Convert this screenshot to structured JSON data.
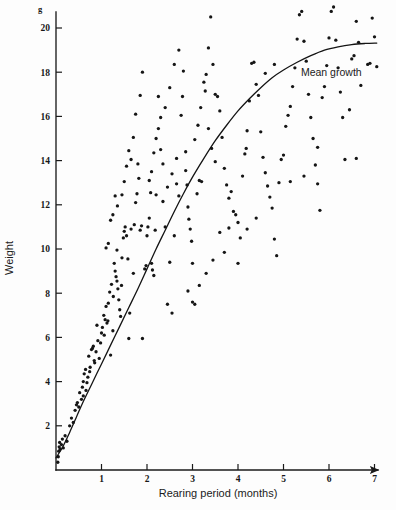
{
  "figure": {
    "background_color": "#fdfdfd",
    "ink_color": "#151515"
  },
  "annotations": {
    "mean_growth_label": "Mean growth",
    "mean_growth_label_x": 6.05,
    "mean_growth_label_y": 17.85
  },
  "chart_data": {
    "type": "scatter",
    "title": "",
    "xlabel": "Rearing period (months)",
    "ylabel": "Weight",
    "yunit": "g",
    "xlim": [
      0,
      7.6
    ],
    "ylim": [
      0,
      21.3
    ],
    "xticks": [
      1,
      2,
      3,
      4,
      5,
      6,
      7
    ],
    "xtick_labels": [
      "1",
      "2",
      "3",
      "4",
      "5",
      "6",
      "7"
    ],
    "yticks": [
      2,
      4,
      6,
      8,
      10,
      12,
      14,
      16,
      18,
      20
    ],
    "ytick_labels": [
      "2",
      "4",
      "6",
      "8",
      "10",
      "12",
      "14",
      "16",
      "18",
      "20"
    ],
    "grid": false,
    "legend": false,
    "x_axis_arrow": true,
    "series": [
      {
        "name": "Mean growth",
        "type": "line",
        "x": [
          0.0,
          0.15,
          0.3,
          0.45,
          0.6,
          0.8,
          1.0,
          1.2,
          1.4,
          1.6,
          1.8,
          2.0,
          2.2,
          2.4,
          2.6,
          2.8,
          3.0,
          3.25,
          3.5,
          3.75,
          4.0,
          4.25,
          4.5,
          4.75,
          5.0,
          5.3,
          5.6,
          5.9,
          6.2,
          6.5,
          6.8,
          7.05
        ],
        "y": [
          0.55,
          1.05,
          1.7,
          2.4,
          3.1,
          3.95,
          4.8,
          5.65,
          6.5,
          7.35,
          8.2,
          9.1,
          10.0,
          10.85,
          11.7,
          12.5,
          13.25,
          14.1,
          14.9,
          15.6,
          16.25,
          16.8,
          17.3,
          17.75,
          18.1,
          18.45,
          18.75,
          19.0,
          19.15,
          19.25,
          19.3,
          19.32
        ]
      },
      {
        "name": "Observations",
        "type": "scatter",
        "points": [
          [
            0.04,
            0.35
          ],
          [
            0.05,
            0.6
          ],
          [
            0.06,
            0.85
          ],
          [
            0.07,
            1.05
          ],
          [
            0.08,
            1.25
          ],
          [
            0.09,
            0.95
          ],
          [
            0.12,
            1.15
          ],
          [
            0.14,
            1.4
          ],
          [
            0.16,
            1.0
          ],
          [
            0.2,
            1.55
          ],
          [
            0.24,
            1.3
          ],
          [
            0.3,
            2.0
          ],
          [
            0.34,
            2.35
          ],
          [
            0.38,
            2.15
          ],
          [
            0.42,
            2.7
          ],
          [
            0.45,
            2.95
          ],
          [
            0.47,
            3.05
          ],
          [
            0.5,
            2.85
          ],
          [
            0.52,
            3.5
          ],
          [
            0.56,
            3.2
          ],
          [
            0.58,
            3.75
          ],
          [
            0.6,
            4.0
          ],
          [
            0.62,
            4.35
          ],
          [
            0.65,
            4.55
          ],
          [
            0.68,
            3.95
          ],
          [
            0.7,
            4.2
          ],
          [
            0.72,
            5.15
          ],
          [
            0.75,
            4.65
          ],
          [
            0.78,
            5.45
          ],
          [
            0.8,
            5.5
          ],
          [
            0.82,
            5.6
          ],
          [
            0.85,
            4.85
          ],
          [
            0.88,
            5.35
          ],
          [
            0.9,
            6.55
          ],
          [
            0.95,
            5.05
          ],
          [
            0.98,
            5.75
          ],
          [
            1.0,
            6.2
          ],
          [
            1.02,
            6.45
          ],
          [
            1.05,
            7.0
          ],
          [
            1.08,
            6.8
          ],
          [
            1.1,
            7.4
          ],
          [
            1.12,
            6.65
          ],
          [
            1.15,
            7.55
          ],
          [
            1.18,
            8.05
          ],
          [
            1.2,
            5.2
          ],
          [
            1.22,
            8.4
          ],
          [
            1.25,
            6.3
          ],
          [
            1.28,
            9.35
          ],
          [
            1.3,
            9.0
          ],
          [
            1.32,
            8.75
          ],
          [
            1.34,
            8.55
          ],
          [
            1.36,
            8.2
          ],
          [
            1.38,
            7.7
          ],
          [
            1.4,
            7.25
          ],
          [
            1.42,
            6.95
          ],
          [
            1.45,
            9.6
          ],
          [
            1.48,
            10.5
          ],
          [
            1.5,
            10.8
          ],
          [
            1.52,
            11.0
          ],
          [
            1.55,
            10.6
          ],
          [
            1.58,
            9.55
          ],
          [
            1.6,
            5.95
          ],
          [
            1.62,
            7.1
          ],
          [
            1.65,
            10.9
          ],
          [
            1.7,
            8.9
          ],
          [
            1.72,
            11.1
          ],
          [
            1.75,
            12.1
          ],
          [
            1.78,
            12.5
          ],
          [
            1.8,
            13.85
          ],
          [
            1.82,
            13.2
          ],
          [
            1.85,
            10.85
          ],
          [
            1.88,
            11.05
          ],
          [
            1.9,
            5.95
          ],
          [
            1.95,
            9.1
          ],
          [
            1.98,
            9.25
          ],
          [
            2.0,
            10.6
          ],
          [
            2.02,
            11.0
          ],
          [
            2.05,
            11.4
          ],
          [
            2.08,
            12.55
          ],
          [
            2.1,
            9.35
          ],
          [
            2.12,
            9.05
          ],
          [
            2.15,
            8.8
          ],
          [
            2.18,
            10.85
          ],
          [
            2.2,
            12.45
          ],
          [
            2.25,
            16.9
          ],
          [
            2.3,
            14.5
          ],
          [
            2.35,
            13.85
          ],
          [
            2.4,
            11.0
          ],
          [
            2.45,
            7.5
          ],
          [
            2.5,
            9.4
          ],
          [
            2.55,
            7.1
          ],
          [
            2.6,
            10.6
          ],
          [
            2.65,
            12.95
          ],
          [
            2.7,
            12.4
          ],
          [
            2.75,
            16.05
          ],
          [
            2.78,
            16.9
          ],
          [
            2.8,
            18.05
          ],
          [
            2.85,
            14.4
          ],
          [
            2.88,
            12.9
          ],
          [
            2.9,
            11.9
          ],
          [
            2.92,
            11.35
          ],
          [
            2.95,
            10.9
          ],
          [
            2.98,
            10.35
          ],
          [
            3.0,
            9.35
          ],
          [
            3.05,
            7.5
          ],
          [
            3.1,
            12.5
          ],
          [
            3.15,
            13.1
          ],
          [
            3.2,
            13.05
          ],
          [
            3.25,
            17.55
          ],
          [
            3.3,
            17.9
          ],
          [
            3.35,
            19.1
          ],
          [
            3.4,
            20.5
          ],
          [
            3.45,
            18.35
          ],
          [
            3.5,
            17.0
          ],
          [
            3.55,
            16.9
          ],
          [
            3.6,
            16.25
          ],
          [
            3.65,
            15.05
          ],
          [
            3.7,
            13.65
          ],
          [
            3.75,
            12.9
          ],
          [
            3.8,
            12.3
          ],
          [
            3.85,
            12.6
          ],
          [
            3.9,
            11.7
          ],
          [
            3.95,
            11.55
          ],
          [
            4.0,
            11.2
          ],
          [
            4.05,
            10.5
          ],
          [
            4.1,
            13.3
          ],
          [
            4.15,
            14.3
          ],
          [
            4.18,
            14.55
          ],
          [
            4.2,
            15.35
          ],
          [
            4.25,
            16.7
          ],
          [
            4.3,
            18.4
          ],
          [
            4.35,
            18.45
          ],
          [
            4.4,
            17.45
          ],
          [
            4.45,
            16.95
          ],
          [
            4.5,
            15.3
          ],
          [
            4.55,
            14.15
          ],
          [
            4.6,
            13.45
          ],
          [
            4.65,
            12.85
          ],
          [
            4.7,
            12.35
          ],
          [
            4.75,
            11.85
          ],
          [
            4.8,
            10.45
          ],
          [
            4.85,
            9.7
          ],
          [
            4.9,
            13.0
          ],
          [
            4.95,
            14.05
          ],
          [
            5.0,
            14.25
          ],
          [
            5.05,
            15.55
          ],
          [
            5.1,
            16.05
          ],
          [
            5.15,
            16.45
          ],
          [
            5.2,
            17.35
          ],
          [
            5.25,
            18.2
          ],
          [
            5.3,
            19.5
          ],
          [
            5.35,
            20.6
          ],
          [
            5.4,
            20.75
          ],
          [
            5.45,
            19.4
          ],
          [
            5.5,
            18.5
          ],
          [
            5.55,
            17.0
          ],
          [
            5.6,
            15.95
          ],
          [
            5.65,
            15.0
          ],
          [
            5.7,
            13.8
          ],
          [
            5.75,
            12.95
          ],
          [
            5.8,
            11.75
          ],
          [
            5.85,
            16.85
          ],
          [
            5.9,
            17.35
          ],
          [
            5.95,
            18.3
          ],
          [
            6.0,
            19.55
          ],
          [
            6.05,
            20.75
          ],
          [
            6.1,
            20.95
          ],
          [
            6.15,
            19.45
          ],
          [
            6.2,
            18.2
          ],
          [
            6.25,
            17.1
          ],
          [
            6.3,
            15.95
          ],
          [
            6.35,
            14.05
          ],
          [
            6.5,
            18.6
          ],
          [
            6.55,
            18.75
          ],
          [
            6.6,
            20.3
          ],
          [
            6.65,
            19.35
          ],
          [
            6.7,
            17.4
          ],
          [
            6.85,
            18.35
          ],
          [
            6.9,
            18.4
          ],
          [
            6.95,
            20.45
          ],
          [
            7.0,
            19.6
          ],
          [
            7.05,
            18.25
          ],
          [
            1.1,
            10.05
          ],
          [
            1.15,
            10.25
          ],
          [
            1.2,
            11.3
          ],
          [
            1.25,
            11.55
          ],
          [
            1.3,
            12.4
          ],
          [
            1.35,
            11.95
          ],
          [
            1.45,
            12.45
          ],
          [
            1.5,
            13.05
          ],
          [
            1.55,
            13.75
          ],
          [
            1.6,
            14.45
          ],
          [
            1.65,
            14.05
          ],
          [
            1.7,
            15.05
          ],
          [
            1.75,
            16.1
          ],
          [
            1.85,
            16.95
          ],
          [
            1.9,
            18.0
          ],
          [
            2.05,
            13.1
          ],
          [
            2.1,
            13.5
          ],
          [
            2.15,
            14.35
          ],
          [
            2.2,
            15.0
          ],
          [
            2.25,
            15.45
          ],
          [
            2.3,
            15.95
          ],
          [
            2.4,
            16.4
          ],
          [
            2.5,
            17.3
          ],
          [
            2.6,
            18.35
          ],
          [
            2.7,
            19.0
          ],
          [
            3.05,
            14.95
          ],
          [
            3.12,
            15.6
          ],
          [
            3.18,
            16.4
          ],
          [
            3.28,
            17.15
          ],
          [
            3.35,
            15.45
          ],
          [
            3.42,
            14.55
          ],
          [
            3.5,
            13.95
          ],
          [
            3.6,
            10.75
          ],
          [
            3.7,
            9.85
          ],
          [
            3.8,
            10.95
          ],
          [
            4.0,
            9.35
          ],
          [
            4.2,
            10.9
          ],
          [
            4.4,
            11.4
          ],
          [
            4.6,
            17.95
          ],
          [
            4.8,
            18.35
          ],
          [
            2.9,
            8.1
          ],
          [
            3.0,
            7.6
          ],
          [
            3.15,
            8.35
          ],
          [
            3.3,
            8.9
          ],
          [
            3.45,
            9.5
          ],
          [
            0.6,
            3.35
          ],
          [
            0.66,
            3.6
          ],
          [
            0.74,
            4.45
          ],
          [
            0.84,
            4.95
          ],
          [
            0.92,
            5.85
          ],
          [
            1.06,
            6.1
          ],
          [
            1.14,
            6.75
          ],
          [
            1.26,
            7.85
          ],
          [
            1.34,
            9.95
          ],
          [
            1.44,
            8.35
          ],
          [
            2.35,
            12.15
          ],
          [
            2.45,
            12.8
          ],
          [
            2.55,
            13.4
          ],
          [
            2.65,
            14.1
          ],
          [
            2.85,
            13.55
          ],
          [
            5.15,
            13.05
          ],
          [
            5.45,
            13.3
          ],
          [
            5.75,
            14.6
          ],
          [
            6.45,
            16.3
          ],
          [
            6.6,
            14.1
          ]
        ]
      }
    ]
  }
}
